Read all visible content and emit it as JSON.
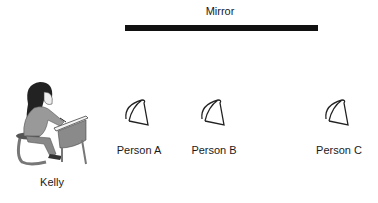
{
  "mirror": {
    "label": "Mirror"
  },
  "observer": {
    "name": "Kelly",
    "icon": "girl-at-desk-icon"
  },
  "people": [
    {
      "label": "Person A",
      "icon": "head-top-view-icon"
    },
    {
      "label": "Person B",
      "icon": "head-top-view-icon"
    },
    {
      "label": "Person C",
      "icon": "head-top-view-icon"
    }
  ]
}
